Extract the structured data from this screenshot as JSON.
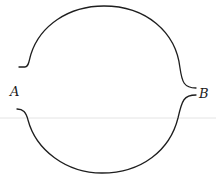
{
  "diagram": {
    "type": "two-arc circuit diagram",
    "labels": {
      "left": "A",
      "right": "B"
    },
    "paths": [
      {
        "name": "upper-arc",
        "from": "A",
        "to": "B"
      },
      {
        "name": "lower-arc",
        "from": "A",
        "to": "B"
      }
    ],
    "colors": {
      "stroke": "#1e1e1e",
      "background": "#ffffff"
    }
  }
}
